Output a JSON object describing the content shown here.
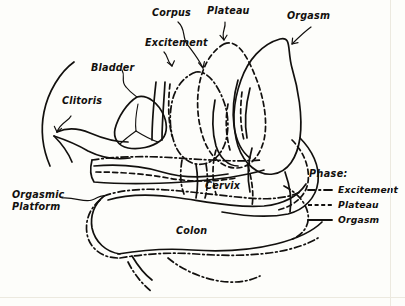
{
  "figure": {
    "background_color": "#fdfdfa",
    "ink_color": "#12100e"
  },
  "labels": {
    "corpus": "Corpus",
    "plateau": "Plateau",
    "orgasm": "Orgasm",
    "excitement": "Excitement",
    "bladder": "Bladder",
    "clitoris": "Clitoris",
    "cervix": "Cervix",
    "colon": "Colon",
    "orgasmic_platform_line1": "Orgasmic",
    "orgasmic_platform_line2": "Platform"
  },
  "legend": {
    "title": "Phase:",
    "items": [
      {
        "label": "Excitement",
        "style": "dash-dot"
      },
      {
        "label": "Plateau",
        "style": "dashed"
      },
      {
        "label": "Orgasm",
        "style": "solid"
      }
    ]
  }
}
